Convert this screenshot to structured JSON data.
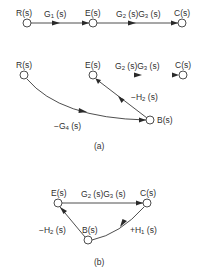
{
  "colors": {
    "line": "#3a3a3a",
    "node_fill": "#ffffff",
    "highlight_start": "#7a5a8a",
    "highlight_green": "#7fe08a"
  },
  "diagram_a_top": {
    "nodes": [
      {
        "id": "R",
        "label": "R(s)"
      },
      {
        "id": "E",
        "label": "E(s)"
      },
      {
        "id": "C",
        "label": "C(s)"
      }
    ],
    "edges": [
      {
        "from": "R",
        "to": "E",
        "gain_main": "G",
        "gain_sub": "1",
        "gain_tail": " (s)"
      },
      {
        "from": "E",
        "to": "C",
        "gain_main": "G",
        "gain_sub": "2",
        "gain_mid": " (s)G",
        "gain_sub2": "3",
        "gain_tail": " (s)"
      }
    ]
  },
  "diagram_a_bottom": {
    "nodes": [
      {
        "id": "R",
        "label": "R(s)"
      },
      {
        "id": "E",
        "label": "E(s)"
      },
      {
        "id": "C",
        "label": "C(s)"
      },
      {
        "id": "B",
        "label": "B(s)"
      }
    ],
    "edges": [
      {
        "from": "E",
        "to": "C",
        "gain_main": "G",
        "gain_sub": "2",
        "gain_mid": " (s)G",
        "gain_sub2": "3",
        "gain_tail": " (s)"
      },
      {
        "from": "B",
        "to": "E",
        "gain_main": "−H",
        "gain_sub": "2",
        "gain_tail": " (s)"
      },
      {
        "from": "R",
        "to": "B",
        "gain_main": "−G",
        "gain_sub": "4",
        "gain_tail": " (s)"
      }
    ]
  },
  "caption_a": "(a)",
  "diagram_b": {
    "nodes": [
      {
        "id": "E",
        "label": "E(s)"
      },
      {
        "id": "C",
        "label": "C(s)"
      },
      {
        "id": "B",
        "label": "B(s)"
      }
    ],
    "edges": [
      {
        "from": "E",
        "to": "C",
        "gain_main": "G",
        "gain_sub": "2",
        "gain_mid": " (s)G",
        "gain_sub2": "3",
        "gain_tail": " (s)"
      },
      {
        "from": "C",
        "to": "B",
        "gain_main": "+H",
        "gain_sub": "1",
        "gain_tail": " (s)"
      },
      {
        "from": "B",
        "to": "E",
        "gain_main": "−H",
        "gain_sub": "2",
        "gain_tail": " (s)"
      }
    ]
  },
  "caption_b": "(b)"
}
